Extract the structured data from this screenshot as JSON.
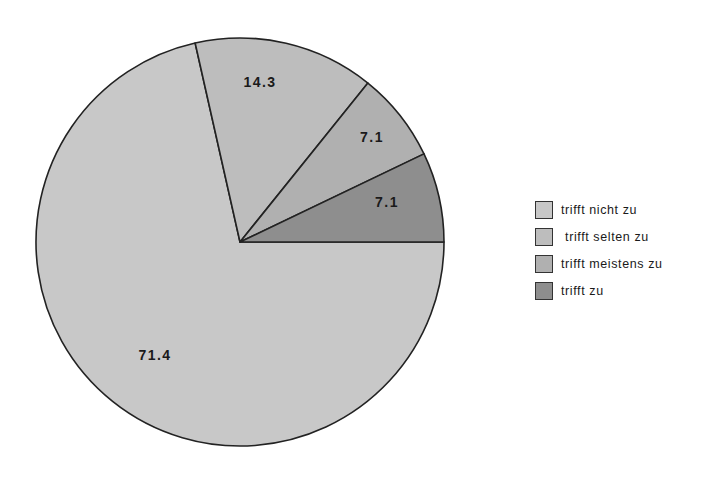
{
  "chart_data": {
    "type": "pie",
    "title": "",
    "categories": [
      "trifft nicht zu",
      "trifft selten zu",
      "trifft meistens zu",
      "trifft zu"
    ],
    "values": [
      71.4,
      14.3,
      7.1,
      7.1
    ],
    "labels": [
      "71.4",
      "14.3",
      "7.1",
      "7.1"
    ],
    "colors": [
      "#c8c8c8",
      "#bdbdbd",
      "#b0b0b0",
      "#8e8e8e"
    ],
    "start_angle_deg": 0,
    "direction": "clockwise-from-east",
    "legend_position": "right"
  },
  "legend": {
    "items": [
      {
        "label": "trifft nicht zu",
        "color": "#c8c8c8"
      },
      {
        "label": " trifft selten zu",
        "color": "#bdbdbd"
      },
      {
        "label": "trifft meistens zu",
        "color": "#b0b0b0"
      },
      {
        "label": "trifft zu",
        "color": "#8e8e8e"
      }
    ]
  }
}
